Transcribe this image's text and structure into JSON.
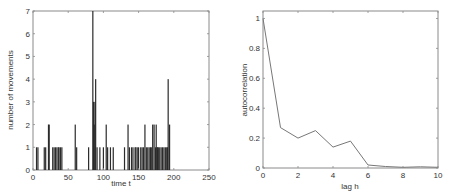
{
  "chart_data": [
    {
      "type": "bar",
      "title": "",
      "xlabel": "time t",
      "ylabel": "number of movements",
      "xlim": [
        0,
        250
      ],
      "ylim": [
        0,
        7
      ],
      "xticks": [
        0,
        50,
        100,
        150,
        200,
        250
      ],
      "yticks": [
        0,
        1,
        2,
        3,
        4,
        5,
        6,
        7
      ],
      "grid": false,
      "x": [
        5,
        7,
        16,
        18,
        22,
        23,
        28,
        30,
        32,
        34,
        36,
        37,
        39,
        41,
        60,
        62,
        79,
        85,
        86,
        87,
        88,
        89,
        91,
        95,
        100,
        104,
        106,
        110,
        114,
        130,
        135,
        137,
        140,
        142,
        145,
        146,
        148,
        150,
        153,
        155,
        157,
        159,
        161,
        163,
        165,
        167,
        168,
        170,
        172,
        174,
        175,
        176,
        177,
        178,
        180,
        182,
        184,
        186,
        188,
        190,
        191,
        192,
        194
      ],
      "values": [
        1,
        1,
        1,
        1,
        2,
        2,
        1,
        1,
        1,
        1,
        1,
        1,
        1,
        1,
        2,
        1,
        1,
        7,
        3,
        2,
        3,
        4,
        1,
        1,
        1,
        2,
        1,
        1,
        1,
        1,
        2,
        1,
        1,
        1,
        1,
        1,
        1,
        1,
        1,
        1,
        1,
        2,
        1,
        1,
        1,
        1,
        1,
        2,
        2,
        1,
        2,
        1,
        1,
        1,
        1,
        1,
        1,
        1,
        1,
        1,
        1,
        4,
        2
      ],
      "bar_color": "#2b2b2b"
    },
    {
      "type": "line",
      "title": "",
      "xlabel": "lag h",
      "ylabel": "autocorrelation",
      "xlim": [
        0,
        10
      ],
      "ylim": [
        0,
        1.05
      ],
      "xticks": [
        0,
        2,
        4,
        6,
        8,
        10
      ],
      "yticks": [
        0,
        0.2,
        0.4,
        0.6,
        0.8,
        1
      ],
      "ytick_labels": [
        "0",
        "0.2",
        "0.4",
        "0.6",
        "0.8",
        "1"
      ],
      "grid": false,
      "x": [
        0,
        1,
        2,
        3,
        4,
        5,
        6,
        7,
        8,
        9,
        10
      ],
      "values": [
        1.0,
        0.27,
        0.2,
        0.25,
        0.14,
        0.18,
        0.02,
        0.01,
        0.005,
        0.008,
        0.005
      ],
      "line_color": "#777777"
    }
  ]
}
